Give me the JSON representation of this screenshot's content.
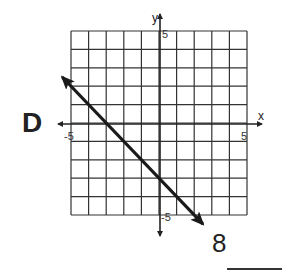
{
  "label": "D",
  "question_number": "8",
  "chart_data": {
    "type": "line",
    "title": "",
    "xlabel": "x",
    "ylabel": "y",
    "xlim": [
      -5,
      5
    ],
    "ylim": [
      -5,
      5
    ],
    "grid": true,
    "tick_labels": {
      "x": [
        "-5",
        "5"
      ],
      "y": [
        "5",
        "-5"
      ]
    },
    "series": [
      {
        "name": "line",
        "x": [
          -5.5,
          2.5
        ],
        "y": [
          2.5,
          -5.5
        ],
        "equation": "y = -x - 3",
        "arrows": "both"
      }
    ],
    "color": "#1a1a1a"
  }
}
